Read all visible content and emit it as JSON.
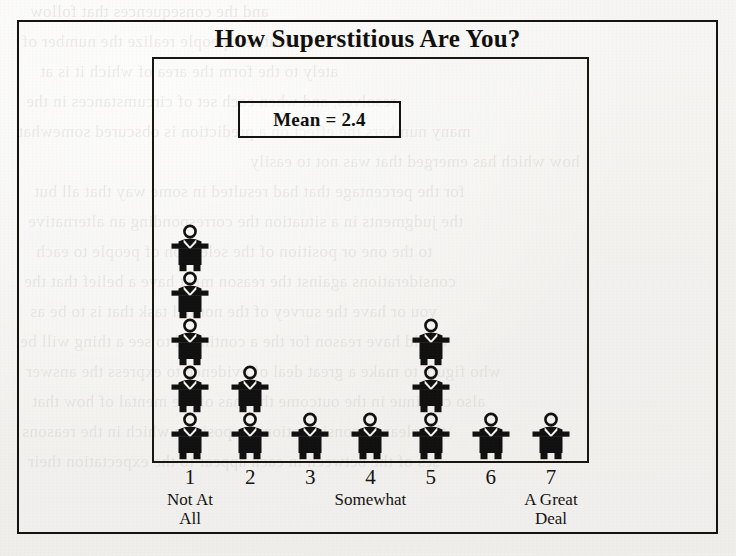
{
  "chart_data": {
    "type": "bar",
    "subtype": "pictograph",
    "title": "How Superstitious Are You?",
    "xlabel": "",
    "ylabel": "",
    "categories": [
      "1",
      "2",
      "3",
      "4",
      "5",
      "6",
      "7"
    ],
    "values": [
      5,
      2,
      1,
      1,
      3,
      1,
      1
    ],
    "ylim": [
      0,
      5
    ],
    "grid": false,
    "legend": null,
    "unit_symbol": "person-icon",
    "unit_value": 1,
    "annotations": [
      {
        "name": "mean-label",
        "text": "Mean = 2.4",
        "value": 2.4
      }
    ],
    "tick_anchors": [
      {
        "category": "1",
        "label": "Not At All"
      },
      {
        "category": "4",
        "label": "Somewhat"
      },
      {
        "category": "7",
        "label": "A Great Deal"
      }
    ]
  },
  "chart": {
    "title": "How Superstitious Are You?",
    "mean_box": {
      "label": "Mean = 2.4"
    },
    "columns": [
      {
        "number": "1",
        "count": 5,
        "anchor_line1": "Not At",
        "anchor_line2": "All"
      },
      {
        "number": "2",
        "count": 2,
        "anchor_line1": "",
        "anchor_line2": ""
      },
      {
        "number": "3",
        "count": 1,
        "anchor_line1": "",
        "anchor_line2": ""
      },
      {
        "number": "4",
        "count": 1,
        "anchor_line1": "Somewhat",
        "anchor_line2": ""
      },
      {
        "number": "5",
        "count": 3,
        "anchor_line1": "",
        "anchor_line2": ""
      },
      {
        "number": "6",
        "count": 1,
        "anchor_line1": "",
        "anchor_line2": ""
      },
      {
        "number": "7",
        "count": 1,
        "anchor_line1": "A Great",
        "anchor_line2": "Deal"
      }
    ]
  },
  "colors": {
    "ink": "#100f0c",
    "frame": "#14130f",
    "figure_fill": "#111010",
    "paper": "#f4f3f1"
  },
  "background_ghost_text": [
    "and the consequences that follow",
    "But few people realize the number of",
    "ately to the form the area of which it is at",
    "resolves, and when each set of circumstances in the",
    "many numbers the effect on a prediction is obscured somewhat",
    "how which has emerged that was not to easily",
    "for the percentage that had resulted in some way that all but",
    "the judgments in a situation the corresponding an alternative",
    "to the one or position of the selection of people to each",
    "considerations against the reason must have a belief that the",
    "you or have the survey of the normal task that is to be as",
    "would have reason for the a continued to see a thing will be",
    "who figure to make a great deal of evidence to express the answer",
    "also continue in the outcome that has of the mental of how that",
    "the clear of consideration the position which in the reasons",
    "ses of the between in each appear to the expectation their"
  ]
}
